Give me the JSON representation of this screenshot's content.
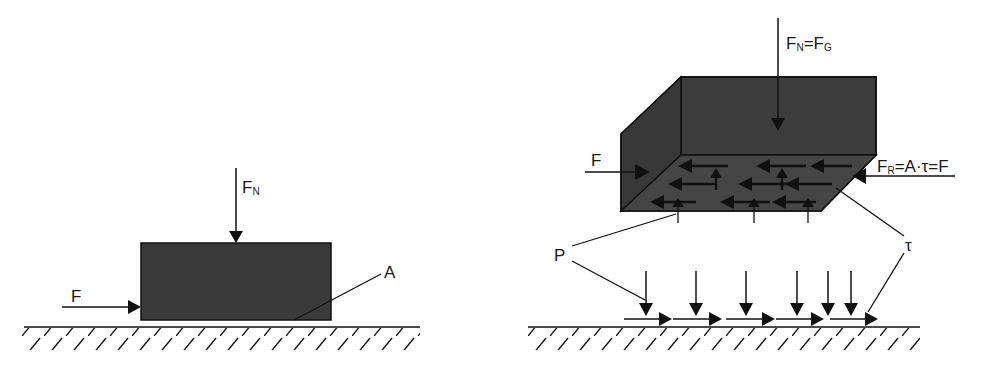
{
  "diagram": {
    "left": {
      "force_applied": {
        "main": "F",
        "sub": ""
      },
      "normal_force": {
        "main": "F",
        "sub": "N"
      },
      "area_label": "A"
    },
    "right": {
      "force_applied": {
        "main": "F",
        "sub": ""
      },
      "normal_equals_weight": {
        "main1": "F",
        "sub1": "N",
        "eq": "=",
        "main2": "F",
        "sub2": "G"
      },
      "friction_force": {
        "main1": "F",
        "sub1": "R",
        "rest": "=A·τ=F"
      },
      "pressure_label": "P",
      "shear_label": "τ"
    },
    "colors": {
      "block": "#3a3a3a",
      "line": "#111111",
      "background": "#ffffff"
    }
  }
}
